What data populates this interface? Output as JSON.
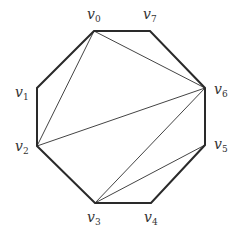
{
  "diagram": {
    "type": "polygon-triangulation",
    "colors": {
      "background": "#ffffff",
      "edge": "#2a2a2a",
      "diagonal": "#444444",
      "label": "#333333"
    },
    "vertices": [
      {
        "id": "v0",
        "name": "v",
        "sub": "0",
        "x": 94,
        "y": 31,
        "lx": 87,
        "ly": 19
      },
      {
        "id": "v1",
        "name": "v",
        "sub": "1",
        "x": 37,
        "y": 88,
        "lx": 15,
        "ly": 97
      },
      {
        "id": "v2",
        "name": "v",
        "sub": "2",
        "x": 37,
        "y": 146,
        "lx": 15,
        "ly": 151
      },
      {
        "id": "v3",
        "name": "v",
        "sub": "3",
        "x": 95,
        "y": 203,
        "lx": 87,
        "ly": 222
      },
      {
        "id": "v4",
        "name": "v",
        "sub": "4",
        "x": 151,
        "y": 203,
        "lx": 144,
        "ly": 222
      },
      {
        "id": "v5",
        "name": "v",
        "sub": "5",
        "x": 205,
        "y": 145,
        "lx": 214,
        "ly": 149
      },
      {
        "id": "v6",
        "name": "v",
        "sub": "6",
        "x": 205,
        "y": 88,
        "lx": 214,
        "ly": 94
      },
      {
        "id": "v7",
        "name": "v",
        "sub": "7",
        "x": 150,
        "y": 31,
        "lx": 143,
        "ly": 19
      }
    ],
    "edges": [
      [
        "v0",
        "v1"
      ],
      [
        "v1",
        "v2"
      ],
      [
        "v2",
        "v3"
      ],
      [
        "v3",
        "v4"
      ],
      [
        "v4",
        "v5"
      ],
      [
        "v5",
        "v6"
      ],
      [
        "v6",
        "v7"
      ],
      [
        "v7",
        "v0"
      ]
    ],
    "diagonals": [
      [
        "v0",
        "v2"
      ],
      [
        "v0",
        "v6"
      ],
      [
        "v2",
        "v6"
      ],
      [
        "v3",
        "v6"
      ],
      [
        "v3",
        "v5"
      ]
    ]
  }
}
